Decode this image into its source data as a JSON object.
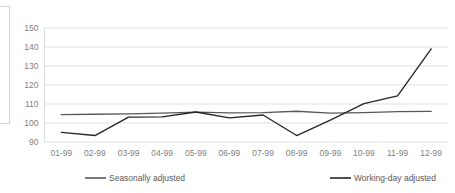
{
  "chart_data": {
    "type": "line",
    "title": "",
    "xlabel": "",
    "ylabel": "",
    "categories": [
      "01-99",
      "02-99",
      "03-99",
      "04-99",
      "05-99",
      "06-99",
      "07-99",
      "08-99",
      "09-99",
      "10-99",
      "11-99",
      "12-99"
    ],
    "ylim": [
      90,
      150
    ],
    "yticks": [
      90,
      100,
      110,
      120,
      130,
      140,
      150
    ],
    "grid": true,
    "legend_position": "bottom",
    "series": [
      {
        "name": "Seasonally adjusted",
        "color": "#595959",
        "values": [
          104.4,
          104.6,
          104.8,
          105.2,
          105.7,
          105.3,
          105.5,
          106.2,
          105.2,
          105.5,
          106.0,
          106.1
        ]
      },
      {
        "name": "Working-day adjusted",
        "color": "#262626",
        "values": [
          95.1,
          93.4,
          103.1,
          103.2,
          105.8,
          102.7,
          104.2,
          93.4,
          101.5,
          110.2,
          114.3,
          139.0
        ]
      }
    ]
  },
  "axis": {
    "ytick_labels": [
      "150",
      "140",
      "130",
      "120",
      "110",
      "100",
      "90"
    ],
    "xtick_labels": [
      "01-99",
      "02-99",
      "03-99",
      "04-99",
      "05-99",
      "06-99",
      "07-99",
      "08-99",
      "09-99",
      "10-99",
      "11-99",
      "12-99"
    ]
  },
  "legend": {
    "items": [
      {
        "label": "Seasonally adjusted",
        "color": "#595959"
      },
      {
        "label": "Working-day adjusted",
        "color": "#262626"
      }
    ]
  },
  "colors": {
    "gridline": "#d9d9d9",
    "tick_text": "#7f7f7f",
    "legend_text": "#595959",
    "background": "#ffffff"
  }
}
